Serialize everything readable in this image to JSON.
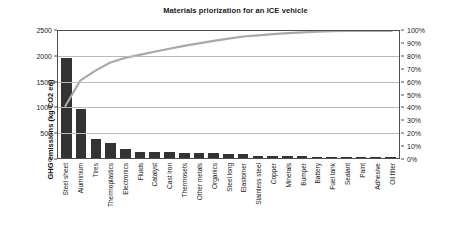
{
  "chart_data": {
    "type": "bar",
    "title": "Materials priorization for an ICE vehicle",
    "xlabel": "",
    "ylabel": "GHG emissions (kg CO2 eq)",
    "ylabel_secondary": "",
    "ylim": [
      0,
      2500
    ],
    "ylim_secondary": [
      0,
      100
    ],
    "grid": true,
    "legend": "none",
    "categories": [
      "Steel sheet",
      "Aluminium",
      "Tires",
      "Thermoplastics",
      "Electronics",
      "Fluids",
      "Catalyst",
      "Cast iron",
      "Thermosets",
      "Other metals",
      "Organics",
      "Steel long",
      "Elastomer",
      "Stainless steel",
      "Copper",
      "Minerals",
      "Bumper",
      "Battery",
      "Fuel tank",
      "Sealant",
      "Paint",
      "Adhesive",
      "Oil filter"
    ],
    "series": [
      {
        "name": "GHG emissions (kg CO2 eq)",
        "type": "bar",
        "axis": "left",
        "color": "#333333",
        "values": [
          1940,
          950,
          360,
          300,
          175,
          120,
          115,
          110,
          105,
          95,
          90,
          85,
          80,
          45,
          40,
          35,
          30,
          25,
          22,
          18,
          14,
          10,
          5
        ]
      },
      {
        "name": "Cumulative %",
        "type": "line",
        "axis": "right",
        "color": "#a8a8a8",
        "values": [
          41.0,
          61.0,
          68.6,
          75.0,
          78.7,
          81.2,
          83.7,
          86.0,
          88.3,
          90.3,
          92.2,
          94.0,
          95.7,
          96.6,
          97.5,
          98.3,
          98.9,
          99.4,
          99.9,
          100.0,
          100.0,
          100.0,
          100.0
        ]
      }
    ],
    "y_ticks_left": [
      "0",
      "500",
      "1000",
      "1500",
      "2000",
      "2500"
    ],
    "y_ticks_right": [
      "0%",
      "10%",
      "20%",
      "30%",
      "40%",
      "50%",
      "60%",
      "70%",
      "80%",
      "90%",
      "100%"
    ]
  }
}
